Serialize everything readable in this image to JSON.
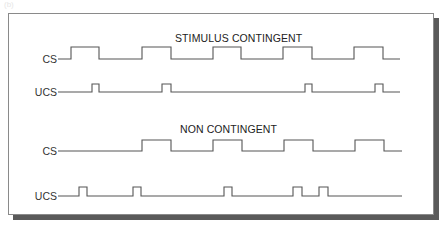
{
  "corner_label": "(b)",
  "panels": [
    {
      "title": "STIMULUS CONTINGENT",
      "rows": [
        {
          "label": "CS",
          "start": 58,
          "end": 400,
          "low_y": 59,
          "high_y": 47,
          "pulses": [
            [
              71,
              99
            ],
            [
              142,
              171
            ],
            [
              213,
              241
            ],
            [
              283,
              312
            ],
            [
              354,
              383
            ]
          ]
        },
        {
          "label": "UCS",
          "start": 58,
          "end": 400,
          "low_y": 92,
          "high_y": 84,
          "pulses": [
            [
              92,
              99
            ],
            [
              162,
              171
            ],
            [
              305,
              312
            ],
            [
              375,
              383
            ]
          ]
        }
      ]
    },
    {
      "title": "NON CONTINGENT",
      "rows": [
        {
          "label": "CS",
          "start": 58,
          "end": 402,
          "low_y": 151,
          "high_y": 140,
          "pulses": [
            [
              142,
              171
            ],
            [
              213,
              242
            ],
            [
              284,
              313
            ],
            [
              355,
              384
            ]
          ]
        },
        {
          "label": "UCS",
          "start": 58,
          "end": 402,
          "low_y": 196,
          "high_y": 187,
          "pulses": [
            [
              79,
              87
            ],
            [
              133,
              141
            ],
            [
              224,
              232
            ],
            [
              293,
              302
            ],
            [
              319,
              328
            ]
          ]
        }
      ]
    }
  ]
}
